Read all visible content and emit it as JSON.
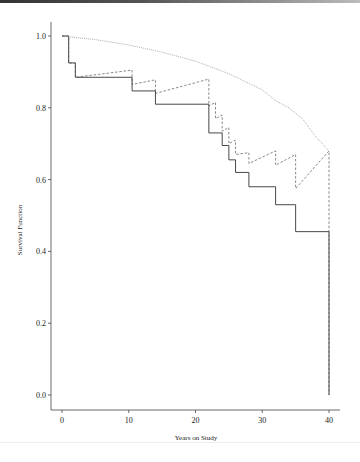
{
  "chart_data": {
    "type": "line",
    "title": "",
    "xlabel": "Years on Study",
    "ylabel": "Survival Function",
    "xlim": [
      0,
      40
    ],
    "ylim": [
      0.0,
      1.0
    ],
    "xticks": [
      "0",
      "10",
      "20",
      "30",
      "40"
    ],
    "yticks": [
      "0.0",
      "0.2",
      "0.4",
      "0.6",
      "0.8",
      "1.0"
    ],
    "grid": false,
    "legend": null,
    "series": [
      {
        "name": "Kaplan-Meier estimate (solid step)",
        "style": "solid-step",
        "x": [
          0,
          1,
          2,
          10.5,
          14,
          22,
          24,
          25,
          26,
          28,
          32,
          35,
          40
        ],
        "values": [
          1.0,
          0.925,
          0.885,
          0.847,
          0.81,
          0.73,
          0.695,
          0.655,
          0.62,
          0.58,
          0.53,
          0.455,
          0.0
        ]
      },
      {
        "name": "Expected survival (dotted smooth)",
        "style": "dotted",
        "x": [
          0,
          5,
          10,
          15,
          20,
          25,
          30,
          32,
          34,
          36,
          38,
          40
        ],
        "values": [
          1.0,
          0.99,
          0.975,
          0.955,
          0.93,
          0.895,
          0.85,
          0.82,
          0.8,
          0.77,
          0.72,
          0.68
        ]
      },
      {
        "name": "Relative survival (dashed)",
        "style": "dashed",
        "x": [
          0,
          1,
          1,
          2,
          2,
          10.5,
          10.5,
          14,
          14,
          22,
          22,
          23,
          23,
          24,
          24,
          25,
          25,
          26,
          26,
          28,
          28,
          32,
          32,
          35,
          35,
          40,
          40
        ],
        "values": [
          1.0,
          1.0,
          0.925,
          0.925,
          0.885,
          0.905,
          0.865,
          0.878,
          0.84,
          0.88,
          0.805,
          0.815,
          0.77,
          0.78,
          0.735,
          0.745,
          0.7,
          0.71,
          0.67,
          0.675,
          0.645,
          0.68,
          0.64,
          0.67,
          0.575,
          0.68,
          0.0
        ]
      }
    ]
  }
}
